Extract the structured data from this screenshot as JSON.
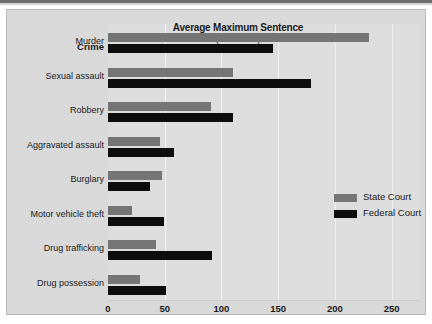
{
  "chart_data": {
    "type": "bar",
    "orientation": "horizontal",
    "title": "Average Maximum Sentence",
    "subtitle": "(in Months)",
    "xlabel": "",
    "ylabel": "Crime",
    "categories": [
      "Murder",
      "Sexual assault",
      "Robbery",
      "Aggravated assault",
      "Burglary",
      "Motor vehicle theft",
      "Drug trafficking",
      "Drug possession"
    ],
    "series": [
      {
        "name": "State Court",
        "color": "#757575",
        "values": [
          230,
          110,
          91,
          46,
          48,
          21,
          42,
          28
        ]
      },
      {
        "name": "Federal Court",
        "color": "#0d0d0d",
        "values": [
          145,
          179,
          110,
          58,
          37,
          49,
          92,
          51
        ]
      }
    ],
    "xlim": [
      0,
      275
    ],
    "xticks": [
      0,
      50,
      100,
      150,
      200,
      250
    ],
    "xtick_labels": [
      "0",
      "50",
      "100",
      "150",
      "200",
      "250"
    ],
    "grid": "vertical",
    "legend_position": "right-middle"
  }
}
